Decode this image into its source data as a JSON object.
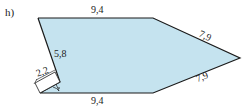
{
  "part_label": "h)",
  "colors": {
    "fill": "#c5e3ef",
    "stroke": "#1a1a1a"
  },
  "dimensions": {
    "top": "9,4",
    "upper_right": "7,9",
    "lower_right": "7,9",
    "bottom": "9,4",
    "left_slant": "5,8",
    "short_side": "2,2"
  }
}
